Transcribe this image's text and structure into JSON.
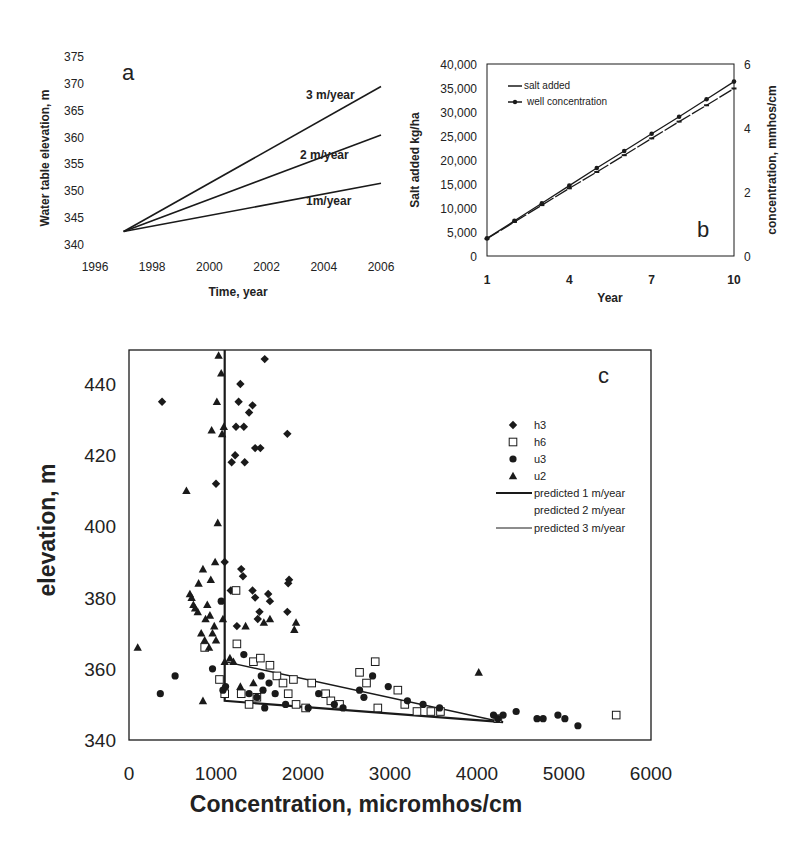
{
  "chart_data": [
    {
      "id": "a",
      "type": "line",
      "panel_label": "a",
      "title": "",
      "xlabel": "Time, year",
      "ylabel": "Water table elevation, m",
      "xlim": [
        1996,
        2006
      ],
      "ylim": [
        340,
        375
      ],
      "xticks": [
        "1996",
        "1998",
        "2000",
        "2002",
        "2004",
        "2006"
      ],
      "yticks": [
        "340",
        "345",
        "350",
        "355",
        "360",
        "365",
        "370",
        "375"
      ],
      "grid": false,
      "series": [
        {
          "name": "3 m/year",
          "x": [
            1997,
            2006
          ],
          "values": [
            342.5,
            369.5
          ]
        },
        {
          "name": "2 m/year",
          "x": [
            1997,
            2006
          ],
          "values": [
            342.5,
            360.5
          ]
        },
        {
          "name": "1 m/year",
          "x": [
            1997,
            2006
          ],
          "values": [
            342.5,
            351.5
          ]
        }
      ],
      "annotations": [
        "3 m/year",
        "2 m/year",
        "1m/year"
      ]
    },
    {
      "id": "b",
      "type": "line",
      "panel_label": "b",
      "title": "",
      "xlabel": "Year",
      "ylabel": "Salt added kg/ha",
      "ylabel_right": "concentration, mmhos/cm",
      "xlim": [
        1,
        10
      ],
      "ylim": [
        0,
        40000
      ],
      "ylim_right": [
        0,
        6
      ],
      "xticks": [
        "1",
        "4",
        "7",
        "10"
      ],
      "yticks": [
        "0",
        "5,000",
        "10,000",
        "15,000",
        "20,000",
        "25,000",
        "30,000",
        "35,000",
        "40,000"
      ],
      "yticks_right": [
        "0",
        "2",
        "4",
        "6"
      ],
      "legend_position": "upper left",
      "grid": false,
      "categories": [
        1,
        2,
        3,
        4,
        5,
        6,
        7,
        8,
        9,
        10
      ],
      "series": [
        {
          "name": "salt added",
          "axis": "left",
          "values": [
            3600,
            7100,
            10600,
            14100,
            17500,
            21000,
            24500,
            28000,
            31400,
            34900
          ]
        },
        {
          "name": "well concentration",
          "axis": "right",
          "values": [
            0.55,
            1.1,
            1.65,
            2.2,
            2.75,
            3.28,
            3.82,
            4.35,
            4.9,
            5.45
          ]
        }
      ]
    },
    {
      "id": "c",
      "type": "scatter",
      "panel_label": "c",
      "title": "",
      "xlabel": "Concentration, micromhos/cm",
      "ylabel": "elevation, m",
      "xlim": [
        0,
        6000
      ],
      "ylim": [
        340,
        450
      ],
      "xticks": [
        "0",
        "1000",
        "2000",
        "3000",
        "4000",
        "5000",
        "6000"
      ],
      "yticks": [
        "340",
        "360",
        "380",
        "400",
        "420",
        "440"
      ],
      "legend_position": "right",
      "grid": false,
      "series": [
        {
          "name": "h3",
          "marker": "diamond",
          "points": [
            [
              380,
              435
            ],
            [
              1000,
              412
            ],
            [
              1100,
              390
            ],
            [
              1180,
              418
            ],
            [
              1220,
              420
            ],
            [
              1230,
              428
            ],
            [
              1260,
              435
            ],
            [
              1280,
              440
            ],
            [
              1320,
              428
            ],
            [
              1330,
              418
            ],
            [
              1380,
              432
            ],
            [
              1420,
              434
            ],
            [
              1450,
              422
            ],
            [
              1510,
              422
            ],
            [
              1560,
              447
            ],
            [
              1820,
              426
            ],
            [
              1170,
              382
            ],
            [
              1240,
              372
            ],
            [
              1290,
              388
            ],
            [
              1310,
              386
            ],
            [
              1420,
              382
            ],
            [
              1450,
              380
            ],
            [
              1480,
              374
            ],
            [
              1500,
              376
            ],
            [
              1600,
              381
            ],
            [
              1620,
              379
            ],
            [
              1820,
              376
            ],
            [
              1830,
              384
            ],
            [
              1840,
              385
            ]
          ]
        },
        {
          "name": "h6",
          "marker": "square",
          "points": [
            [
              870,
              366
            ],
            [
              1040,
              357
            ],
            [
              1100,
              353
            ],
            [
              1230,
              382
            ],
            [
              1240,
              367
            ],
            [
              1290,
              353
            ],
            [
              1380,
              350
            ],
            [
              1430,
              362
            ],
            [
              1470,
              352
            ],
            [
              1510,
              363
            ],
            [
              1620,
              361
            ],
            [
              1700,
              358
            ],
            [
              1770,
              356
            ],
            [
              1830,
              353
            ],
            [
              1890,
              357
            ],
            [
              1920,
              350
            ],
            [
              2030,
              349
            ],
            [
              2100,
              356
            ],
            [
              2260,
              353
            ],
            [
              2320,
              351
            ],
            [
              2420,
              350
            ],
            [
              2650,
              359
            ],
            [
              2730,
              356
            ],
            [
              2830,
              362
            ],
            [
              2860,
              349
            ],
            [
              3090,
              354
            ],
            [
              3170,
              350
            ],
            [
              3310,
              348
            ],
            [
              3470,
              348
            ],
            [
              3580,
              348
            ],
            [
              4240,
              346
            ],
            [
              5600,
              347
            ]
          ]
        },
        {
          "name": "u3",
          "marker": "circle",
          "points": [
            [
              360,
              353
            ],
            [
              530,
              358
            ],
            [
              960,
              360
            ],
            [
              1060,
              379
            ],
            [
              1080,
              354
            ],
            [
              1110,
              355
            ],
            [
              1320,
              364
            ],
            [
              1380,
              353
            ],
            [
              1470,
              352
            ],
            [
              1520,
              358
            ],
            [
              1540,
              354
            ],
            [
              1560,
              349
            ],
            [
              1610,
              356
            ],
            [
              1680,
              353
            ],
            [
              1800,
              350
            ],
            [
              2060,
              349
            ],
            [
              2180,
              353
            ],
            [
              2360,
              350
            ],
            [
              2460,
              349
            ],
            [
              2650,
              354
            ],
            [
              2700,
              352
            ],
            [
              2800,
              358
            ],
            [
              2980,
              355
            ],
            [
              3200,
              351
            ],
            [
              3380,
              350
            ],
            [
              3570,
              349
            ],
            [
              4190,
              347
            ],
            [
              4240,
              346
            ],
            [
              4300,
              347
            ],
            [
              4450,
              348
            ],
            [
              4690,
              346
            ],
            [
              4760,
              346
            ],
            [
              4930,
              347
            ],
            [
              5010,
              346
            ],
            [
              5160,
              344
            ]
          ]
        },
        {
          "name": "u2",
          "marker": "triangle",
          "points": [
            [
              100,
              366
            ],
            [
              660,
              410
            ],
            [
              700,
              381
            ],
            [
              720,
              380
            ],
            [
              740,
              378
            ],
            [
              760,
              377
            ],
            [
              790,
              376
            ],
            [
              800,
              384
            ],
            [
              830,
              370
            ],
            [
              850,
              388
            ],
            [
              870,
              368
            ],
            [
              880,
              374
            ],
            [
              900,
              378
            ],
            [
              920,
              366
            ],
            [
              930,
              375
            ],
            [
              940,
              385
            ],
            [
              950,
              427
            ],
            [
              960,
              370
            ],
            [
              980,
              372
            ],
            [
              990,
              390
            ],
            [
              1000,
              368
            ],
            [
              1010,
              435
            ],
            [
              1020,
              401
            ],
            [
              1030,
              448
            ],
            [
              1060,
              443
            ],
            [
              1070,
              426
            ],
            [
              1080,
              374
            ],
            [
              1090,
              428
            ],
            [
              1100,
              362
            ],
            [
              1160,
              363
            ],
            [
              1200,
              362
            ],
            [
              1280,
              355
            ],
            [
              1340,
              372
            ],
            [
              1430,
              356
            ],
            [
              1550,
              373
            ],
            [
              1620,
              374
            ],
            [
              1900,
              371
            ],
            [
              1920,
              373
            ],
            [
              850,
              351
            ],
            [
              4020,
              359
            ]
          ]
        }
      ],
      "lines": [
        {
          "name": "predicted 1 m/year",
          "x": [
            1100,
            1100,
            4300
          ],
          "values": [
            450,
            351,
            345
          ],
          "style": "thick"
        },
        {
          "name": "predicted 2 m/year",
          "x": [],
          "values": [],
          "style": "none"
        },
        {
          "name": "predicted 3 m/year",
          "x": [
            1100,
            4300
          ],
          "values": [
            362,
            345
          ],
          "style": "thin"
        }
      ]
    }
  ],
  "colors": {
    "ink": "#1a1a1a",
    "background": "#ffffff"
  }
}
